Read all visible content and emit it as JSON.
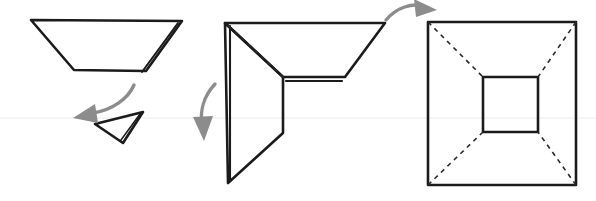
{
  "canvas": {
    "width": 596,
    "height": 201,
    "background": "#ffffff",
    "title": "Paper folding step diagram"
  },
  "colors": {
    "ink": "#1b1b1b",
    "crease": "#2a2a2a",
    "arrow": "#8c8c8c",
    "scanline": "#f2f2f2",
    "background": "#ffffff"
  },
  "steps": [
    {
      "id": "step-1",
      "label": "Step 1",
      "description": "Wide trapezoid with doubled right edge and a small detached triangle below",
      "shapes": [
        {
          "id": "trapezoid-outline",
          "name": "trapezoid",
          "type": "polygon",
          "points": "31,20 182,21 146,71 74,70"
        },
        {
          "id": "trapezoid-fold-edge",
          "name": "doubled-right-edge",
          "type": "polyline",
          "points": "178,23 142,72"
        },
        {
          "id": "small-triangle",
          "name": "detached-triangle",
          "type": "polygon",
          "points": "95,124 143,112 123,143"
        },
        {
          "id": "small-triangle-edge",
          "name": "triangle-doubled-edge",
          "type": "polyline",
          "points": "140,114 121,140"
        }
      ]
    },
    {
      "id": "step-2",
      "label": "Step 2",
      "description": "Partially folded form: upper trapezoid flap and lower flap with dashed crease lines",
      "shapes": [
        {
          "id": "upper-flap",
          "name": "upper-trapezoid-flap",
          "type": "polygon",
          "points": "225,23 385,23 345,77 283,77"
        },
        {
          "id": "lower-flap",
          "name": "lower-flap",
          "type": "polygon",
          "points": "225,23 283,77 283,133 228,183"
        },
        {
          "id": "left-spine",
          "name": "left-spine-doubled-edge",
          "type": "polyline",
          "points": "230,26 230,180"
        },
        {
          "id": "horizontal-doubled",
          "name": "horizontal-doubled-edge",
          "type": "polyline",
          "points": "286,81 342,81"
        },
        {
          "id": "crease-diagonal",
          "name": "dashed-crease-diagonal",
          "type": "polyline",
          "points": "228,25 283,77"
        }
      ]
    },
    {
      "id": "step-3",
      "label": "Step 3",
      "description": "Finished flat square with inner square and four dashed diagonal creases to the corners",
      "shapes": [
        {
          "id": "outer-square",
          "name": "outer-square",
          "type": "polygon",
          "points": "428,22 576,22 576,185 428,185"
        },
        {
          "id": "inner-square",
          "name": "inner-square",
          "type": "polygon",
          "points": "483,77 538,77 538,132 483,132"
        },
        {
          "id": "crease-tl",
          "name": "dashed-crease-top-left",
          "type": "polyline",
          "points": "428,22 483,77"
        },
        {
          "id": "crease-tr",
          "name": "dashed-crease-top-right",
          "type": "polyline",
          "points": "576,22 538,77"
        },
        {
          "id": "crease-bl",
          "name": "dashed-crease-bottom-left",
          "type": "polyline",
          "points": "428,185 483,132"
        },
        {
          "id": "crease-br",
          "name": "dashed-crease-bottom-right",
          "type": "polyline",
          "points": "576,185 538,132"
        }
      ]
    }
  ],
  "arrows": [
    {
      "id": "arrow-1",
      "name": "fold-down-left-arrow",
      "direction": "down-left",
      "path": "M 134,85 C 128,99 112,110 93,113",
      "head": "95,105 75,118 97,122"
    },
    {
      "id": "arrow-2",
      "name": "fold-down-arrow",
      "direction": "down",
      "path": "M 215,84 C 203,97 200,112 202,124",
      "head": "194,118 204,140 212,117"
    },
    {
      "id": "arrow-3",
      "name": "fold-flat-arrow",
      "direction": "up-right",
      "path": "M 386,20 C 397,7 412,3 424,6",
      "head": "415,0 436,9 417,16"
    }
  ],
  "artifacts": [
    {
      "id": "scan-line",
      "name": "scanner-seam-line",
      "type": "line",
      "points": "0,118 596,118"
    }
  ]
}
